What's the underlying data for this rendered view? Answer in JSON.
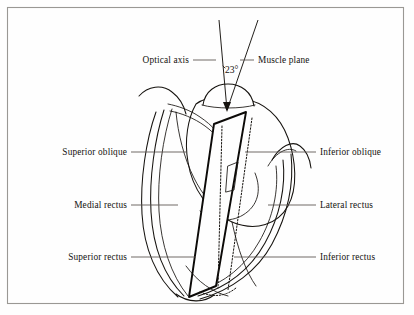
{
  "figure": {
    "background_color": "#fefefe",
    "ink_color": "#16130f",
    "frame_color": "#9a9894"
  },
  "annotations": {
    "optical_axis": "Optical axis",
    "muscle_plane": "Muscle plane",
    "angle": "23°"
  },
  "labels_left": [
    {
      "id": "superior-oblique",
      "text": "Superior oblique"
    },
    {
      "id": "medial-rectus",
      "text": "Medial rectus"
    },
    {
      "id": "superior-rectus",
      "text": "Superior rectus"
    }
  ],
  "labels_right": [
    {
      "id": "inferior-oblique",
      "text": "Inferior oblique"
    },
    {
      "id": "lateral-rectus",
      "text": "Lateral rectus"
    },
    {
      "id": "inferior-rectus",
      "text": "Inferior rectus"
    }
  ]
}
